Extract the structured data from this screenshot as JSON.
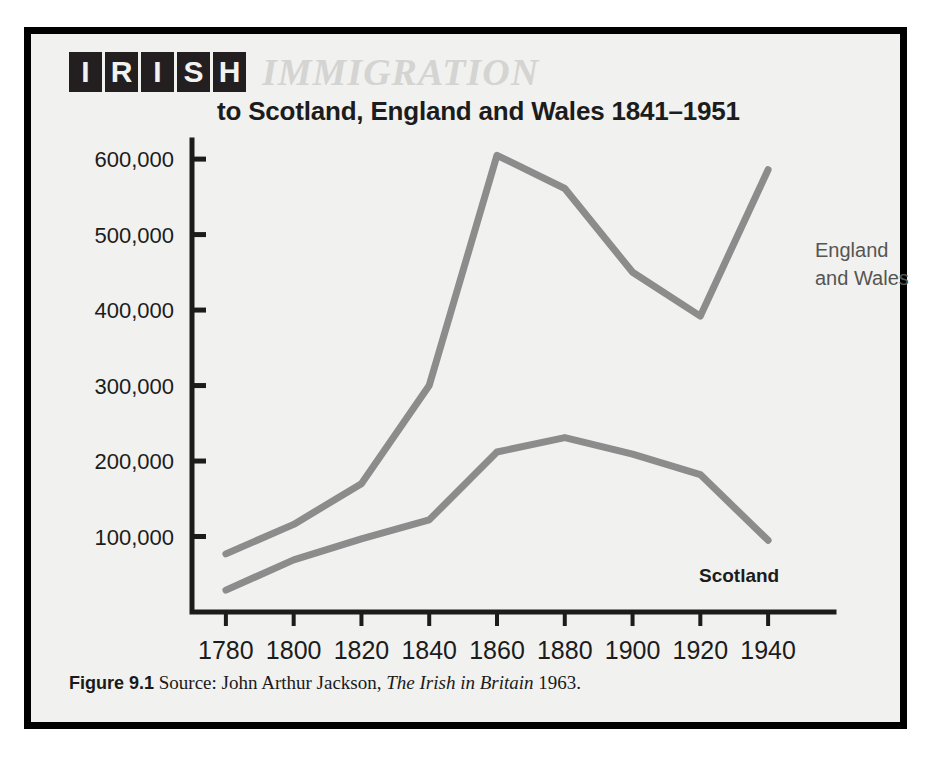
{
  "figure": {
    "title_blocks": [
      "I",
      "R",
      "I",
      "S",
      "H"
    ],
    "title_word": "IMMIGRATION",
    "subtitle": "to Scotland, England and Wales 1841–1951",
    "caption_label": "Figure 9.1",
    "caption_source_prefix": " Source: John Arthur Jackson, ",
    "caption_book": "The Irish in Britain",
    "caption_year": " 1963."
  },
  "colors": {
    "frame": "#000000",
    "panel": "#f1f1ef",
    "axis": "#1c1c1c",
    "line": "#8c8c8c",
    "title_box": "#231f20",
    "title_box_text": "#f2f2f0",
    "immigration_gray": "#d4d4d2",
    "england_label": "#555553",
    "scotland_label": "#1c1c1c"
  },
  "chart_data": {
    "type": "line",
    "subtitle": "to Scotland, England and Wales 1841–1951",
    "xlabel": "",
    "ylabel": "",
    "x": [
      1780,
      1800,
      1820,
      1840,
      1860,
      1880,
      1900,
      1920,
      1940
    ],
    "xtick_labels": [
      "1780",
      "1800",
      "1820",
      "1840",
      "1860",
      "1880",
      "1900",
      "1920",
      "1940"
    ],
    "ytick_values": [
      100000,
      200000,
      300000,
      400000,
      500000,
      600000
    ],
    "ytick_labels": [
      "100,000",
      "200,000",
      "300,000",
      "400,000",
      "500,000",
      "600,000"
    ],
    "xlim": [
      1770,
      1950
    ],
    "ylim": [
      0,
      620000
    ],
    "grid": false,
    "legend": "inline-annotations",
    "series": [
      {
        "name": "England and Wales",
        "label": "England\nand Wales",
        "label_line1": "England",
        "label_line2": "and Wales",
        "color": "#8c8c8c",
        "values": [
          77000,
          116000,
          170000,
          300000,
          605000,
          561000,
          450000,
          392000,
          586000
        ]
      },
      {
        "name": "Scotland",
        "label": "Scotland",
        "label_line1": "Scotland",
        "color": "#8c8c8c",
        "values": [
          29000,
          69000,
          97000,
          122000,
          212000,
          231000,
          209000,
          182000,
          95000
        ]
      }
    ]
  }
}
